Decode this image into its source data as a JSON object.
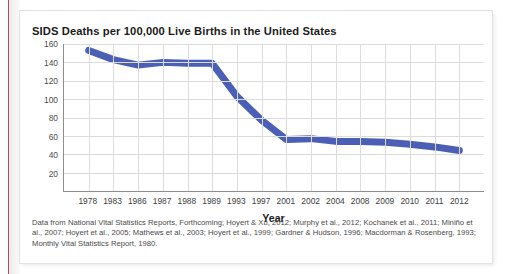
{
  "figure": {
    "title": "SIDS Deaths per 100,000 Live Births in the United States",
    "source_note": "Data from National Vital Statistics Reports, Forthcoming; Hoyert & Xu, 2012; Murphy et al., 2012; Kochanek et al., 2011; Miniño et al., 2007; Hoyert et al., 2005; Mathews et al., 2003; Hoyert et al., 1999; Gardner & Hudson, 1996; Macdorman & Rosenberg, 1993; Monthly Vital Statistics Report, 1980."
  },
  "colors": {
    "series_line": "#4a5fb5",
    "grid": "#dcdcdc",
    "axis": "#8d8d8d",
    "page_rule": "#9e2b45"
  },
  "chart_data": {
    "type": "line",
    "title": "SIDS Deaths per 100,000 Live Births in the United States",
    "xlabel": "Year",
    "ylabel": "",
    "grid": true,
    "legend": "none",
    "ylim": [
      0,
      160
    ],
    "yticks": [
      160,
      140,
      120,
      100,
      80,
      60,
      40,
      20
    ],
    "categories": [
      "1978",
      "1983",
      "1986",
      "1987",
      "1988",
      "1989",
      "1993",
      "1997",
      "2001",
      "2002",
      "2004",
      "2008",
      "2009",
      "2010",
      "2011",
      "2012"
    ],
    "series": [
      {
        "name": "SIDS deaths per 100,000 live births",
        "values": [
          153,
          143,
          137,
          140,
          139,
          139,
          103,
          77,
          56,
          57,
          54,
          54,
          53,
          51,
          48,
          44
        ]
      }
    ]
  }
}
